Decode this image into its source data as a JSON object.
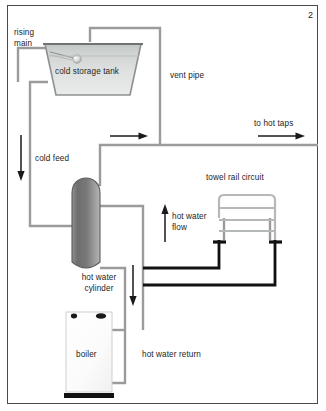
{
  "figure": {
    "number": "2",
    "type": "plumbing-schematic",
    "title_visible": false
  },
  "labels": {
    "rising_main": "rising\nmain",
    "cold_storage_tank": "cold storage tank",
    "vent_pipe": "vent pipe",
    "to_hot_taps": "to hot taps",
    "cold_feed": "cold feed",
    "towel_rail_circuit": "towel rail circuit",
    "hot_water_flow": "hot water\nflow",
    "hot_water_cylinder": "hot water\ncylinder",
    "boiler": "boiler",
    "hot_water_return": "hot water return"
  },
  "components": [
    {
      "name": "cold-storage-tank",
      "label": "cold storage tank"
    },
    {
      "name": "ball-valve",
      "label": ""
    },
    {
      "name": "hot-water-cylinder",
      "label": "hot water cylinder"
    },
    {
      "name": "boiler",
      "label": "boiler"
    },
    {
      "name": "towel-rail",
      "label": "towel rail circuit"
    }
  ],
  "flow_arrows": [
    {
      "name": "cold-feed-arrow",
      "direction": "down",
      "label": "cold feed"
    },
    {
      "name": "vent-pipe-arrow",
      "direction": "right",
      "label": ""
    },
    {
      "name": "to-hot-taps-arrow",
      "direction": "right",
      "label": "to hot taps"
    },
    {
      "name": "hot-water-flow-arrow",
      "direction": "up",
      "label": "hot water flow"
    },
    {
      "name": "hot-water-return-arrow",
      "direction": "down",
      "label": "hot water return"
    }
  ],
  "colors": {
    "frame": "#4a4a4a",
    "pipe_light": "#9b9b9b",
    "pipe_dark": "#111111",
    "tank_fill_top": "#c9cdcb",
    "tank_fill_bottom": "#e3e6e4",
    "cylinder_fill_top": "#6f6f6f",
    "cylinder_fill_bottom": "#a9a9a9",
    "boiler_fill": "#fbfbfb",
    "text": "#1d1d1d"
  }
}
